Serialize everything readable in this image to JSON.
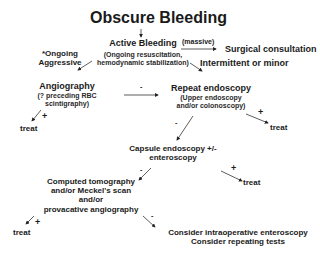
{
  "diagram": {
    "title": "Obscure Bleeding",
    "nodes": {
      "active_bleeding": {
        "label": "Active Bleeding",
        "sub_line1": "(Ongoing resuscitation,",
        "sub_line2": "hemodynamic stabilization)"
      },
      "ongoing_aggressive": {
        "line1": "*Ongoing",
        "line2": "Aggressive"
      },
      "surgical_consultation": {
        "label": "Surgical consultation"
      },
      "intermittent_minor": {
        "label": "Intermittent or minor"
      },
      "angiography": {
        "label": "Angiography",
        "sub_line1": "(? preceding RBC",
        "sub_line2": "scintigraphy)"
      },
      "repeat_endoscopy": {
        "label": "Repeat endoscopy",
        "sub_line1": "(Upper endoscopy",
        "sub_line2": "and/or colonoscopy)"
      },
      "treat_1": {
        "label": "treat"
      },
      "treat_2": {
        "label": "treat"
      },
      "capsule": {
        "line1": "Capsule endoscopy +/-",
        "line2": "enteroscopy"
      },
      "treat_3": {
        "label": "treat"
      },
      "ct": {
        "line1": "Computed tomography",
        "line2": "and/or Meckel's scan",
        "line3": "and/or",
        "line4": "provacative angiography"
      },
      "treat_4": {
        "label": "treat"
      },
      "consider": {
        "line1": "Consider intraoperative enteroscopy",
        "line2": "Consider repeating tests"
      }
    },
    "edge_labels": {
      "massive": "(massive)",
      "angio_neg": "-",
      "angio_pos": "+",
      "repeat_neg": "-",
      "repeat_pos": "+",
      "capsule_neg": "-",
      "capsule_pos": "+",
      "ct_pos": "+",
      "ct_neg": "-"
    }
  }
}
